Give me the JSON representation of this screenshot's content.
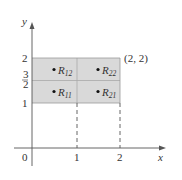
{
  "diagram": {
    "axes": {
      "x_label": "x",
      "y_label": "y",
      "origin_label": "0"
    },
    "x_ticks": [
      "1",
      "2"
    ],
    "y_ticks": [
      "1",
      "2"
    ],
    "y_fraction_tick": {
      "numerator": "3",
      "denominator": "2"
    },
    "corner_label": "(2, 2)",
    "subrectangles": [
      {
        "name": "R",
        "sub": "12"
      },
      {
        "name": "R",
        "sub": "22"
      },
      {
        "name": "R",
        "sub": "11"
      },
      {
        "name": "R",
        "sub": "21"
      }
    ],
    "colors": {
      "fill": "#d9d9d9",
      "grid": "#aaaaaa",
      "axis": "#555555"
    }
  }
}
